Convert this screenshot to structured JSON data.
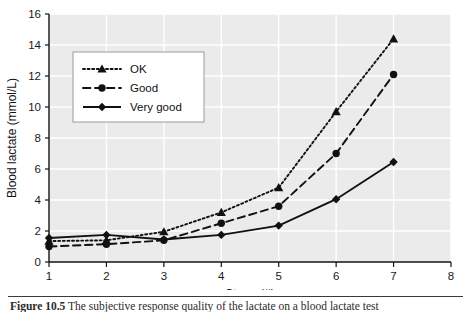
{
  "figure": {
    "caption_number": "Figure 10.5",
    "caption_text": "The subjective response quality of the lactate on a blood lactate test"
  },
  "chart_data": {
    "type": "line",
    "title": "",
    "xlabel": "Stage (#)",
    "ylabel": "Blood lactate (mmol/L)",
    "x": [
      1,
      2,
      3,
      4,
      5,
      6,
      7
    ],
    "xlim": [
      1,
      8
    ],
    "ylim": [
      0,
      16
    ],
    "xticks": [
      1,
      2,
      3,
      4,
      5,
      6,
      7,
      8
    ],
    "yticks": [
      0,
      2,
      4,
      6,
      8,
      10,
      12,
      14,
      16
    ],
    "xtick_labels": [
      "1",
      "2",
      "3",
      "4",
      "5",
      "6",
      "7",
      "8"
    ],
    "ytick_labels": [
      "0",
      "2",
      "4",
      "6",
      "8",
      "10",
      "12",
      "14",
      "16"
    ],
    "grid": true,
    "grid_color": "#ffffff",
    "plot_bg": "#ebebeb",
    "legend_position": "upper left",
    "series": [
      {
        "name": "OK",
        "values": [
          1.35,
          1.4,
          1.95,
          3.2,
          4.8,
          9.7,
          14.4
        ],
        "line_style": "dotted",
        "marker": "triangle",
        "color": "#111111"
      },
      {
        "name": "Good",
        "values": [
          1.0,
          1.15,
          1.4,
          2.5,
          3.6,
          7.0,
          12.1
        ],
        "line_style": "dashed",
        "marker": "circle",
        "color": "#111111"
      },
      {
        "name": "Very good",
        "values": [
          1.55,
          1.75,
          1.45,
          1.75,
          2.35,
          4.05,
          6.45
        ],
        "line_style": "solid",
        "marker": "diamond",
        "color": "#111111"
      }
    ]
  }
}
